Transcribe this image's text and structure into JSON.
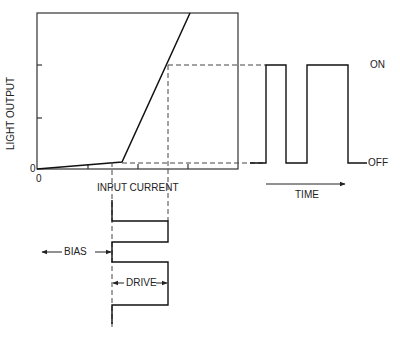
{
  "diagram": {
    "title": "",
    "y_axis_label": "LIGHT OUTPUT",
    "x_axis_label": "INPUT CURRENT",
    "origin_x": "0",
    "origin_y": "0",
    "on_label": "ON",
    "off_label": "OFF",
    "time_label": "TIME",
    "bias_label": "BIAS",
    "drive_label": "DRIVE"
  }
}
